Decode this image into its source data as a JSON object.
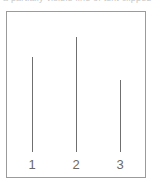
{
  "caption": {
    "clipped_text": "a partially visible line of text clipped above the figure"
  },
  "figure": {
    "frame": {
      "left": 6,
      "top": 11,
      "width": 140,
      "height": 167,
      "border_color": "#9b9b9b"
    },
    "baseline_y": 152,
    "line_color": "#6f6f6f",
    "label_color": "#6a6a6a"
  },
  "chart_data": {
    "type": "bar",
    "title": "",
    "subtitle": "",
    "xlabel": "",
    "ylabel": "",
    "categories": [
      "1",
      "2",
      "3"
    ],
    "values": [
      95,
      115,
      72
    ],
    "ylim": [
      0,
      140
    ],
    "grid": false,
    "legend": null,
    "annotations": [],
    "stems": [
      {
        "label": "1",
        "x": 32,
        "top_y": 57,
        "bottom_y": 152,
        "height": 95
      },
      {
        "label": "2",
        "x": 76,
        "top_y": 37,
        "bottom_y": 152,
        "height": 115
      },
      {
        "label": "3",
        "x": 120,
        "top_y": 80,
        "bottom_y": 152,
        "height": 72
      }
    ],
    "tick_labels": [
      {
        "text": "1",
        "x": 32,
        "y": 158
      },
      {
        "text": "2",
        "x": 76,
        "y": 158
      },
      {
        "text": "3",
        "x": 120,
        "y": 158
      }
    ]
  }
}
